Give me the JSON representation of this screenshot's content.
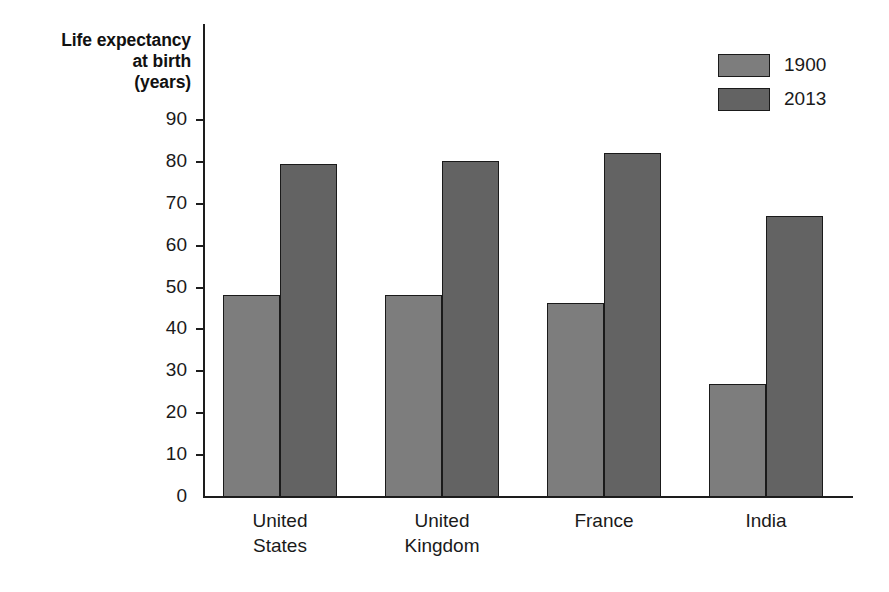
{
  "chart_data": {
    "type": "bar",
    "title": "",
    "subtitle": "",
    "xlabel": "",
    "ylabel": "Life expectancy\nat birth\n(years)",
    "ylim": [
      0,
      90
    ],
    "yticks": [
      0,
      10,
      20,
      30,
      40,
      50,
      60,
      70,
      80,
      90
    ],
    "ytick_labels": [
      "0",
      "10",
      "20",
      "30",
      "40",
      "50",
      "60",
      "70",
      "80",
      "90"
    ],
    "grid": false,
    "legend_position": "top-right",
    "categories": [
      "United States",
      "United Kingdom",
      "France",
      "India"
    ],
    "category_label_lines": [
      [
        "United",
        "States"
      ],
      [
        "United",
        "Kingdom"
      ],
      [
        "France"
      ],
      [
        "India"
      ]
    ],
    "series": [
      {
        "name": "1900",
        "color": "#7d7d7d",
        "values": [
          48.3,
          48.2,
          46.3,
          27.0
        ]
      },
      {
        "name": "2013",
        "color": "#636363",
        "values": [
          79.5,
          80.3,
          82.2,
          67.2
        ]
      }
    ]
  },
  "axis": {
    "y_title_lines": [
      "Life expectancy",
      "at birth",
      "(years)"
    ]
  },
  "legend": {
    "items": [
      {
        "label": "1900",
        "swatch": "legend-swatch-1900"
      },
      {
        "label": "2013",
        "swatch": "legend-swatch-2013"
      }
    ]
  },
  "colors": {
    "series_1900": "#7d7d7d",
    "series_2013": "#636363",
    "axis": "#1d1d1d",
    "text": "#1a1a1a",
    "background": "#ffffff"
  }
}
